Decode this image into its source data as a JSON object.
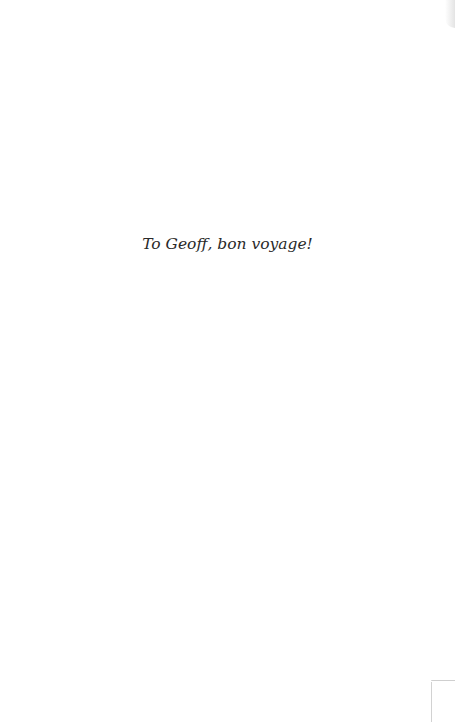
{
  "page": {
    "dedication_text": "To Geoff, bon voyage!",
    "background_color": "#ffffff",
    "text_color": "#2a2a2a"
  }
}
